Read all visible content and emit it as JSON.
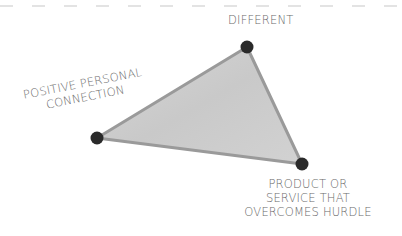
{
  "diagram": {
    "type": "triangle",
    "vertices": [
      {
        "id": "top",
        "label_lines": [
          "DIFFERENT"
        ]
      },
      {
        "id": "left",
        "label_lines": [
          "POSITIVE PERSONAL",
          "CONNECTION"
        ]
      },
      {
        "id": "bottom-right",
        "label_lines": [
          "PRODUCT OR",
          "SERVICE THAT",
          "OVERCOMES HURDLE"
        ]
      }
    ],
    "colors": {
      "fill": "#cfcfcf",
      "edge": "#9a9a9a",
      "node": "#2a2a2a",
      "text": "#6a6a6a",
      "dash": "#c8c8c8"
    }
  }
}
